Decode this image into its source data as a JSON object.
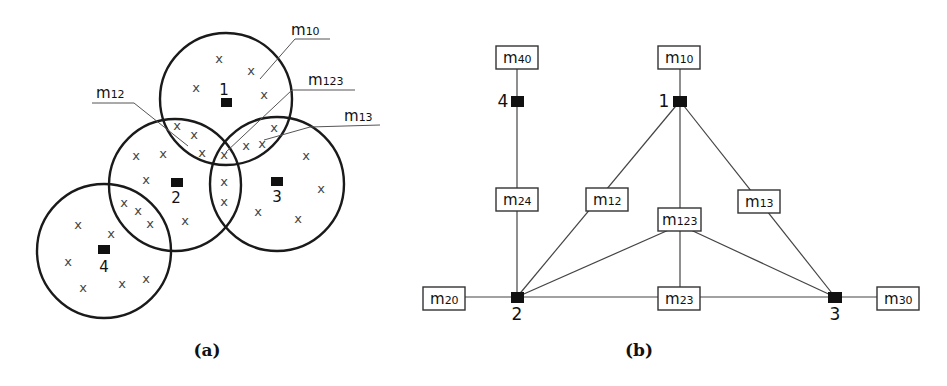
{
  "panel_a": {
    "caption": "(a)",
    "sites": [
      {
        "id": "1",
        "label": "1"
      },
      {
        "id": "2",
        "label": "2"
      },
      {
        "id": "3",
        "label": "3"
      },
      {
        "id": "4",
        "label": "4"
      }
    ],
    "region_labels": [
      {
        "id": "m10",
        "base": "m",
        "sub": "10"
      },
      {
        "id": "m123",
        "base": "m",
        "sub": "123"
      },
      {
        "id": "m12",
        "base": "m",
        "sub": "12"
      },
      {
        "id": "m13",
        "base": "m",
        "sub": "13"
      }
    ],
    "point_marker": "x"
  },
  "panel_b": {
    "caption": "(b)",
    "nodes": [
      {
        "id": "1",
        "label": "1"
      },
      {
        "id": "2",
        "label": "2"
      },
      {
        "id": "3",
        "label": "3"
      },
      {
        "id": "4",
        "label": "4"
      }
    ],
    "boxes": [
      {
        "id": "m40",
        "base": "m",
        "sub": "40"
      },
      {
        "id": "m10",
        "base": "m",
        "sub": "10"
      },
      {
        "id": "m24",
        "base": "m",
        "sub": "24"
      },
      {
        "id": "m12",
        "base": "m",
        "sub": "12"
      },
      {
        "id": "m123",
        "base": "m",
        "sub": "123"
      },
      {
        "id": "m13",
        "base": "m",
        "sub": "13"
      },
      {
        "id": "m20",
        "base": "m",
        "sub": "20"
      },
      {
        "id": "m23",
        "base": "m",
        "sub": "23"
      },
      {
        "id": "m30",
        "base": "m",
        "sub": "30"
      }
    ],
    "edges": [
      [
        "m40",
        "4"
      ],
      [
        "4",
        "m24"
      ],
      [
        "m24",
        "2"
      ],
      [
        "m10",
        "1"
      ],
      [
        "1",
        "m12"
      ],
      [
        "1",
        "m123"
      ],
      [
        "1",
        "m13"
      ],
      [
        "m12",
        "2"
      ],
      [
        "m123",
        "2"
      ],
      [
        "m123",
        "3"
      ],
      [
        "m123",
        "m23"
      ],
      [
        "m13",
        "3"
      ],
      [
        "m20",
        "2"
      ],
      [
        "2",
        "m23"
      ],
      [
        "m23",
        "3"
      ],
      [
        "3",
        "m30"
      ]
    ]
  }
}
